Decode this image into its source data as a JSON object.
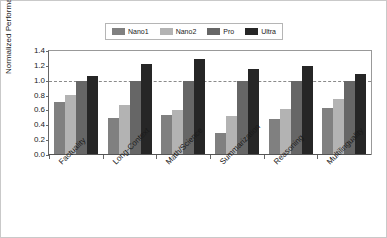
{
  "chart_data": {
    "type": "bar",
    "title": "",
    "xlabel": "",
    "ylabel": "Normalized Performance vs Pro",
    "ylim": [
      0.0,
      1.4
    ],
    "yticks": [
      "0.0",
      "0.2",
      "0.4",
      "0.6",
      "0.8",
      "1.0",
      "1.2",
      "1.4"
    ],
    "grid": false,
    "legend_position": "top-center",
    "reference_line": 1.0,
    "categories": [
      "Factuality",
      "Long-Context",
      "Math/Science",
      "Summarization",
      "Reasoning",
      "Multilinguality"
    ],
    "series": [
      {
        "name": "Nano1",
        "color": "#808080",
        "values": [
          0.71,
          0.5,
          0.54,
          0.29,
          0.49,
          0.63
        ]
      },
      {
        "name": "Nano2",
        "color": "#b3b3b3",
        "values": [
          0.81,
          0.67,
          0.61,
          0.53,
          0.62,
          0.76
        ]
      },
      {
        "name": "Pro",
        "color": "#666666",
        "values": [
          1.0,
          1.0,
          1.0,
          1.0,
          1.0,
          1.0
        ]
      },
      {
        "name": "Ultra",
        "color": "#262626",
        "values": [
          1.06,
          1.23,
          1.29,
          1.16,
          1.2,
          1.09
        ]
      }
    ]
  }
}
